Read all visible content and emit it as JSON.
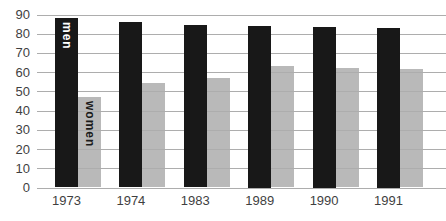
{
  "chart_data": {
    "type": "bar",
    "categories": [
      "1973",
      "1974",
      "1983",
      "1989",
      "1990",
      "1991"
    ],
    "series": [
      {
        "name": "men",
        "values": [
          88,
          86,
          84.5,
          84,
          83.5,
          83
        ]
      },
      {
        "name": "women",
        "values": [
          47,
          54.5,
          57,
          63,
          62,
          61.5
        ]
      }
    ],
    "ylim": [
      0,
      90
    ],
    "yticks": [
      0,
      10,
      20,
      30,
      40,
      50,
      60,
      70,
      80,
      90
    ],
    "grid": true,
    "legend_position": "inside-first-bars"
  },
  "colors": {
    "background": "#ffffff",
    "men_bar": "#181818",
    "women_bar": "#b9b9b9",
    "gridline": "#adadad",
    "tick_label": "#3f3f3f",
    "men_label_text": "#ffffff",
    "women_label_text": "#1b1b1b"
  }
}
